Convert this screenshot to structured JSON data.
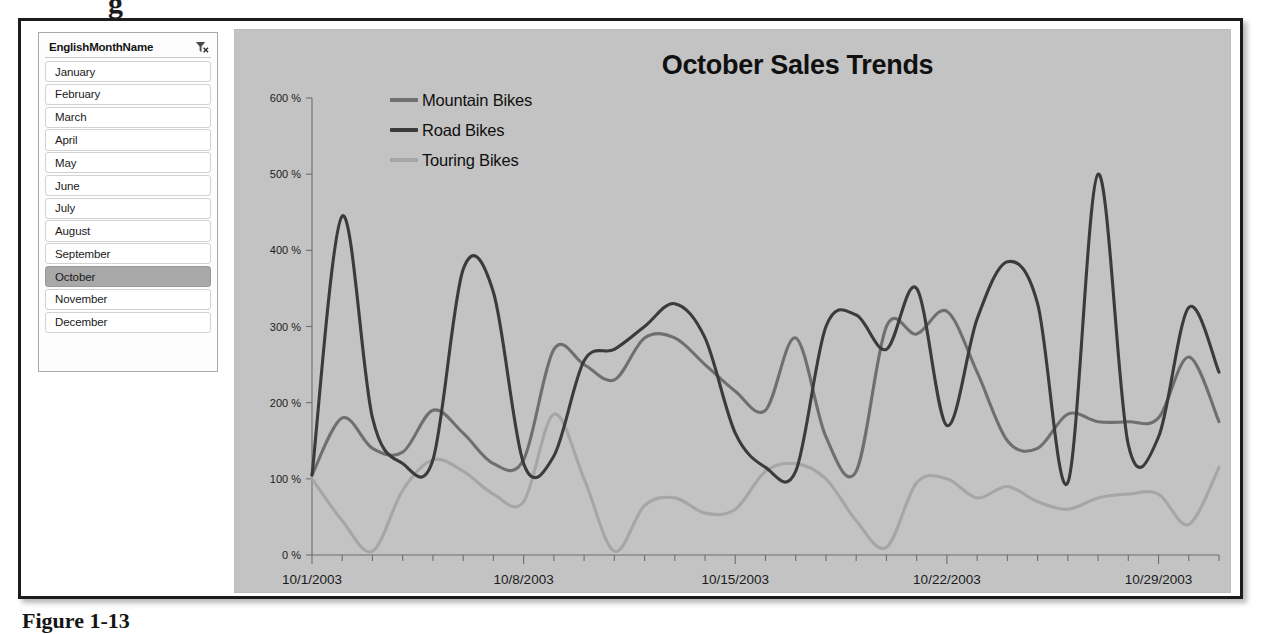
{
  "figure": {
    "caption": "Figure 1-13",
    "top_artifact": "g"
  },
  "slicer": {
    "title": "EnglishMonthName",
    "clear_filter_icon": "clear-filter-icon",
    "selected": "October",
    "items": [
      {
        "label": "January",
        "selected": false
      },
      {
        "label": "February",
        "selected": false
      },
      {
        "label": "March",
        "selected": false
      },
      {
        "label": "April",
        "selected": false
      },
      {
        "label": "May",
        "selected": false
      },
      {
        "label": "June",
        "selected": false
      },
      {
        "label": "July",
        "selected": false
      },
      {
        "label": "August",
        "selected": false
      },
      {
        "label": "September",
        "selected": false
      },
      {
        "label": "October",
        "selected": true
      },
      {
        "label": "November",
        "selected": false
      },
      {
        "label": "December",
        "selected": false
      }
    ]
  },
  "colors": {
    "panel_background": "#c3c3c3",
    "mountain_bikes": "#6f6f6f",
    "road_bikes": "#3b3b3b",
    "touring_bikes": "#a6a6a6",
    "axis": "#6e6e6e",
    "text": "#1b1b1b",
    "selected_item": "#a8a8a8"
  },
  "chart_data": {
    "type": "line",
    "title": "October Sales Trends",
    "xlabel": "",
    "ylabel": "",
    "ylim": [
      0,
      600
    ],
    "yticks": [
      0,
      100,
      200,
      300,
      400,
      500,
      600
    ],
    "ytick_labels": [
      "0 %",
      "100 %",
      "200 %",
      "300 %",
      "400 %",
      "500 %",
      "600 %"
    ],
    "grid": false,
    "legend_position": "top-left",
    "x": [
      "10/1/2003",
      "10/2/2003",
      "10/3/2003",
      "10/4/2003",
      "10/5/2003",
      "10/6/2003",
      "10/7/2003",
      "10/8/2003",
      "10/9/2003",
      "10/10/2003",
      "10/11/2003",
      "10/12/2003",
      "10/13/2003",
      "10/14/2003",
      "10/15/2003",
      "10/16/2003",
      "10/17/2003",
      "10/18/2003",
      "10/19/2003",
      "10/20/2003",
      "10/21/2003",
      "10/22/2003",
      "10/23/2003",
      "10/24/2003",
      "10/25/2003",
      "10/26/2003",
      "10/27/2003",
      "10/28/2003",
      "10/29/2003",
      "10/30/2003",
      "10/31/2003"
    ],
    "xtick_labels": [
      "10/1/2003",
      "10/8/2003",
      "10/15/2003",
      "10/22/2003",
      "10/29/2003"
    ],
    "xtick_indices": [
      0,
      7,
      14,
      21,
      28
    ],
    "series": [
      {
        "name": "Mountain Bikes",
        "color": "#6f6f6f",
        "values": [
          105,
          180,
          140,
          135,
          190,
          160,
          120,
          125,
          270,
          250,
          230,
          285,
          285,
          250,
          215,
          190,
          285,
          155,
          110,
          300,
          290,
          320,
          240,
          150,
          140,
          185,
          175,
          175,
          180,
          260,
          175
        ]
      },
      {
        "name": "Road Bikes",
        "color": "#3b3b3b",
        "values": [
          105,
          445,
          180,
          120,
          125,
          375,
          345,
          120,
          130,
          255,
          270,
          300,
          330,
          285,
          160,
          115,
          110,
          300,
          315,
          270,
          350,
          170,
          310,
          385,
          330,
          95,
          500,
          145,
          155,
          325,
          240
        ]
      },
      {
        "name": "Touring Bikes",
        "color": "#a6a6a6",
        "values": [
          100,
          45,
          5,
          85,
          125,
          110,
          80,
          70,
          185,
          100,
          5,
          65,
          75,
          55,
          60,
          110,
          120,
          100,
          45,
          10,
          95,
          100,
          75,
          90,
          70,
          60,
          75,
          80,
          80,
          40,
          115
        ]
      }
    ]
  }
}
